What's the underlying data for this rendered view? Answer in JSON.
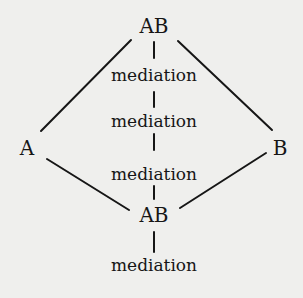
{
  "diagram": {
    "nodes": {
      "top": {
        "label": "AB",
        "x": 154,
        "y": 26
      },
      "left": {
        "label": "A",
        "x": 27,
        "y": 148
      },
      "right": {
        "label": "B",
        "x": 280,
        "y": 148
      },
      "bottom": {
        "label": "AB",
        "x": 154,
        "y": 215
      }
    },
    "mediations": [
      {
        "label": "mediation",
        "x": 154,
        "y": 75
      },
      {
        "label": "mediation",
        "x": 154,
        "y": 121
      },
      {
        "label": "mediation",
        "x": 154,
        "y": 174
      },
      {
        "label": "mediation",
        "x": 154,
        "y": 265
      }
    ],
    "edges": [
      {
        "from": "AB (top)",
        "to": "A"
      },
      {
        "from": "AB (top)",
        "to": "B"
      },
      {
        "from": "A",
        "to": "AB (bottom)"
      },
      {
        "from": "B",
        "to": "AB (bottom)"
      }
    ],
    "colors": {
      "background": "#efefed",
      "ink": "#161616"
    }
  }
}
